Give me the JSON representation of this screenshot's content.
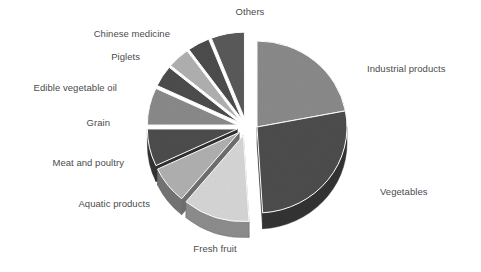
{
  "chart_data": {
    "type": "pie",
    "title": "",
    "subtitle": "",
    "xlabel": "",
    "ylabel": "",
    "legend_position": "around-slices",
    "grid": false,
    "style": "3d-exploded-grayscale",
    "categories": [
      "Industrial products",
      "Vegetables",
      "Fresh fruit",
      "Aquatic products",
      "Meat and poultry",
      "Grain",
      "Edible vegetable oil",
      "Piglets",
      "Chinese medicine",
      "Others"
    ],
    "values": [
      22,
      27,
      12,
      7,
      7,
      7,
      4,
      4,
      4,
      6
    ],
    "colors": [
      "#8a8a8a",
      "#4d4d4d",
      "#d6d6d6",
      "#b0b0b0",
      "#4d4d4d",
      "#8a8a8a",
      "#4d4d4d",
      "#b0b0b0",
      "#4d4d4d",
      "#5a5a5a"
    ],
    "exploded": [
      false,
      false,
      true,
      true,
      true,
      true,
      true,
      true,
      true,
      true
    ],
    "slices": [
      {
        "label": "Industrial products",
        "value": 22,
        "color": "#8a8a8a"
      },
      {
        "label": "Vegetables",
        "value": 27,
        "color": "#4d4d4d"
      },
      {
        "label": "Fresh fruit",
        "value": 12,
        "color": "#d6d6d6"
      },
      {
        "label": "Aquatic products",
        "value": 7,
        "color": "#b0b0b0"
      },
      {
        "label": "Meat and poultry",
        "value": 7,
        "color": "#4d4d4d"
      },
      {
        "label": "Grain",
        "value": 7,
        "color": "#8a8a8a"
      },
      {
        "label": "Edible vegetable oil",
        "value": 4,
        "color": "#4d4d4d"
      },
      {
        "label": "Piglets",
        "value": 4,
        "color": "#b0b0b0"
      },
      {
        "label": "Chinese medicine",
        "value": 4,
        "color": "#4d4d4d"
      },
      {
        "label": "Others",
        "value": 6,
        "color": "#5a5a5a"
      }
    ]
  },
  "labels": {
    "others": "Others",
    "chinese_medicine": "Chinese medicine",
    "piglets": "Piglets",
    "edible_vegetable_oil": "Edible vegetable oil",
    "grain": "Grain",
    "meat_and_poultry": "Meat and poultry",
    "aquatic_products": "Aquatic products",
    "fresh_fruit": "Fresh fruit",
    "industrial_products": "Industrial products",
    "vegetables": "Vegetables"
  }
}
